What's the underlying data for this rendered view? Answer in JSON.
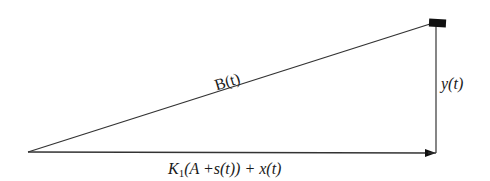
{
  "diagram": {
    "type": "right-triangle vector diagram",
    "labels": {
      "hypotenuse": "B(t)",
      "vertical": "y(t)",
      "base": {
        "K": "K",
        "sub": "1",
        "rest": "(A +s(t)) + x(t)"
      }
    },
    "elements": [
      {
        "id": "hypotenuse",
        "from": "left vertex",
        "to": "top-right block",
        "label": "B(t)"
      },
      {
        "id": "vertical-side",
        "from": "top-right block",
        "to": "bottom-right corner",
        "label": "y(t)"
      },
      {
        "id": "base-arrow",
        "from": "left vertex",
        "to": "bottom-right corner",
        "label": "K1(A +s(t)) + x(t)",
        "arrowhead": true
      },
      {
        "id": "mass-block",
        "position": "top-right corner",
        "shape": "filled rectangle"
      }
    ],
    "colors": {
      "line": "#333333",
      "block": "#111111",
      "background": "#ffffff"
    }
  }
}
